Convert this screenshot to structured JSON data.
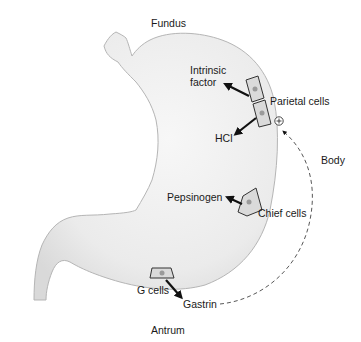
{
  "diagram": {
    "regions": {
      "fundus": "Fundus",
      "body": "Body",
      "antrum": "Antrum"
    },
    "cells": {
      "parietal": "Parietal cells",
      "chief": "Chief cells",
      "g": "G cells"
    },
    "secretions": {
      "intrinsic_factor_line1": "Intrinsic",
      "intrinsic_factor_line2": "factor",
      "hcl": "HCl",
      "pepsinogen": "Pepsinogen",
      "gastrin": "Gastrin"
    },
    "stimulation_symbol": "+",
    "colors": {
      "stomach_fill": "#ececec",
      "stomach_outline": "#b5b5b5",
      "cell_fill": "#dadada",
      "cell_outline": "#333333",
      "nucleus": "#9a9a9a",
      "arrow": "#111111",
      "text": "#1a1a1a"
    }
  }
}
